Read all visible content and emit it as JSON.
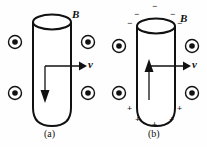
{
  "figure": {
    "background_color": "#fefefe",
    "ink_color": "#111111",
    "width": 207,
    "height": 147
  },
  "panels": [
    {
      "id": "a",
      "caption": "(a)",
      "field_label": "B",
      "velocity_label": "v",
      "field_direction": "out-of-page",
      "field_symbol": "dot-in-circle",
      "field_dots": [
        {
          "cx": 15,
          "cy": 42
        },
        {
          "cx": 15,
          "cy": 93
        },
        {
          "cx": 88,
          "cy": 42
        },
        {
          "cx": 88,
          "cy": 93
        }
      ],
      "inner_arrow_direction": "down",
      "inner_arrow_label": "",
      "charges": [],
      "rod": {
        "x": 33,
        "y": 14,
        "width": 38,
        "height": 112
      }
    },
    {
      "id": "b",
      "caption": "(b)",
      "field_label": "B",
      "velocity_label": "v",
      "field_direction": "out-of-page",
      "field_symbol": "dot-in-circle",
      "field_dots": [
        {
          "cx": 15,
          "cy": 42
        },
        {
          "cx": 15,
          "cy": 93
        },
        {
          "cx": 88,
          "cy": 42
        },
        {
          "cx": 88,
          "cy": 93
        }
      ],
      "inner_arrow_direction": "up",
      "inner_arrow_label": "",
      "rod": {
        "x": 33,
        "y": 14,
        "width": 38,
        "height": 112
      },
      "charges": [
        {
          "sign": "−",
          "x": 48,
          "y": 2
        },
        {
          "sign": "−",
          "x": 30,
          "y": 10
        },
        {
          "sign": "−",
          "x": 66,
          "y": 10
        },
        {
          "sign": "−",
          "x": 23,
          "y": 19
        },
        {
          "sign": "−",
          "x": 73,
          "y": 19
        },
        {
          "sign": "+",
          "x": 23,
          "y": 104
        },
        {
          "sign": "+",
          "x": 73,
          "y": 104
        },
        {
          "sign": "+",
          "x": 31,
          "y": 115
        },
        {
          "sign": "+",
          "x": 65,
          "y": 115
        },
        {
          "sign": "+",
          "x": 48,
          "y": 120
        }
      ]
    }
  ],
  "labels": {
    "panel_a_B": {
      "text": "B",
      "x": 72,
      "y": 10
    },
    "panel_a_v": {
      "text": "v",
      "x": 88,
      "y": 63
    },
    "panel_a_caption": {
      "text": "(a)",
      "x": 44,
      "y": 128
    },
    "panel_b_B": {
      "text": "B",
      "x": 76,
      "y": 14
    },
    "panel_b_v": {
      "text": "v",
      "x": 88,
      "y": 63
    },
    "panel_b_caption": {
      "text": "(b)",
      "x": 44,
      "y": 128
    }
  }
}
